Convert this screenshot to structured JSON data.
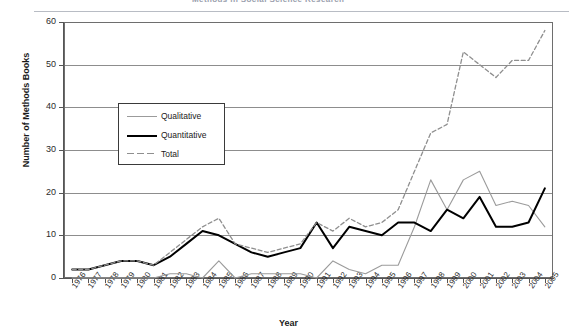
{
  "header": {
    "title": "Methods in Social Science Research",
    "clipped": true
  },
  "axes": {
    "y_title": "Number of Methods Books",
    "x_title": "Year",
    "y_ticks": [
      0,
      10,
      20,
      30,
      40,
      50,
      60
    ],
    "y_min": 0,
    "y_max": 60,
    "grid": "horizontal"
  },
  "legend": {
    "position": "inside-upper-left",
    "items": [
      {
        "label": "Qualitative",
        "style": "solid-thin-gray",
        "color": "#9b9b9b"
      },
      {
        "label": "Quantitative",
        "style": "solid-thick-black",
        "color": "#000000"
      },
      {
        "label": "Total",
        "style": "dashed-gray",
        "color": "#8f8f8f"
      }
    ]
  },
  "chart_data": {
    "type": "line",
    "title": "Methods in Social Science Research",
    "xlabel": "Year",
    "ylabel": "Number of Methods Books",
    "ylim": [
      0,
      60
    ],
    "grid": true,
    "legend_position": "inside-upper-left",
    "categories": [
      "1976",
      "1977",
      "1978",
      "1979",
      "1980",
      "1981",
      "1982",
      "1983",
      "1984",
      "1985",
      "1986",
      "1987",
      "1988",
      "1989",
      "1990",
      "1991",
      "1992",
      "1993",
      "1994",
      "1995",
      "1996",
      "1997",
      "1998",
      "1999",
      "2000",
      "2001",
      "2002",
      "2003",
      "2004",
      "2005"
    ],
    "series": [
      {
        "name": "Qualitative",
        "color": "#9b9b9b",
        "values": [
          0,
          0,
          0,
          0,
          0,
          0,
          1,
          1,
          0,
          4,
          0,
          1,
          1,
          1,
          1,
          0,
          4,
          2,
          1,
          3,
          3,
          12,
          23,
          16,
          23,
          25,
          17,
          18,
          17,
          12
        ]
      },
      {
        "name": "Quantitative",
        "color": "#000000",
        "values": [
          2,
          2,
          3,
          4,
          4,
          3,
          5,
          8,
          11,
          10,
          8,
          6,
          5,
          6,
          7,
          13,
          7,
          12,
          11,
          10,
          13,
          13,
          11,
          16,
          14,
          19,
          12,
          12,
          13,
          21
        ]
      },
      {
        "name": "Total",
        "color": "#8f8f8f",
        "values": [
          2,
          2,
          3,
          4,
          4,
          3,
          6,
          9,
          12,
          14,
          8,
          7,
          6,
          7,
          8,
          13,
          11,
          14,
          12,
          13,
          16,
          25,
          34,
          36,
          53,
          50,
          47,
          51,
          51,
          58
        ]
      }
    ]
  }
}
